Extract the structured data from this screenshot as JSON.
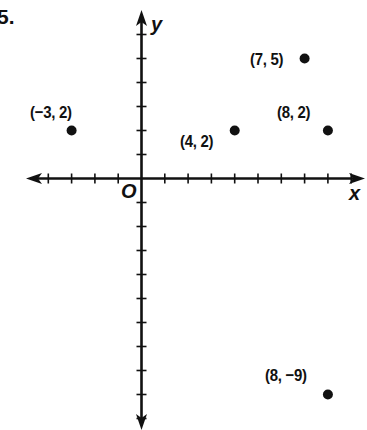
{
  "problem_number": "5.",
  "chart_data": {
    "type": "scatter",
    "title": "",
    "xlabel": "x",
    "ylabel": "y",
    "origin_label": "O",
    "xlim": [
      -4,
      9
    ],
    "ylim": [
      -10,
      6
    ],
    "x_ticks": [
      -4,
      -3,
      -2,
      -1,
      1,
      2,
      3,
      4,
      5,
      6,
      7,
      8,
      9
    ],
    "y_ticks": [
      6,
      5,
      4,
      3,
      2,
      1,
      -1,
      -2,
      -3,
      -4,
      -5,
      -6,
      -7,
      -8,
      -9,
      -10
    ],
    "grid": false,
    "axis_arrows": [
      "left",
      "right",
      "up",
      "down"
    ],
    "points": [
      {
        "x": -3,
        "y": 2,
        "label": "(−3, 2)"
      },
      {
        "x": 4,
        "y": 2,
        "label": "(4, 2)"
      },
      {
        "x": 7,
        "y": 5,
        "label": "(7, 5)"
      },
      {
        "x": 8,
        "y": 2,
        "label": "(8, 2)"
      },
      {
        "x": 8,
        "y": -9,
        "label": "(8, −9)"
      }
    ]
  },
  "colors": {
    "ink": "#111111",
    "background": "#ffffff"
  }
}
